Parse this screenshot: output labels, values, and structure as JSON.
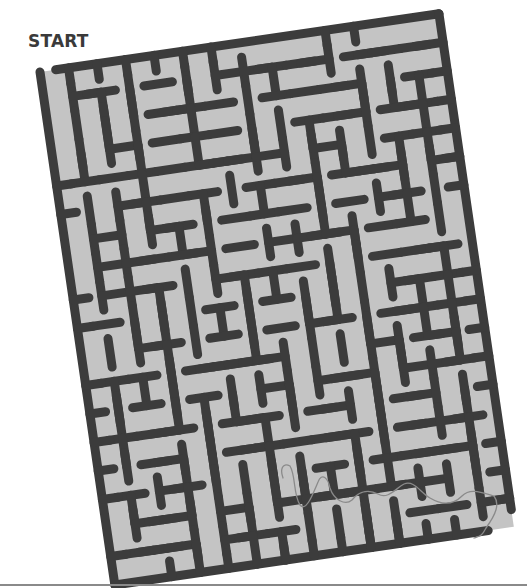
{
  "puzzle": {
    "start_label": "START",
    "finish_label": "FINISH",
    "colors": {
      "wall": "#3c3c3c",
      "floor": "#c4c4c4",
      "background": "#ffffff",
      "pencil_path": "#8a8a8a"
    },
    "grid": {
      "cols": 14,
      "rows": 18,
      "cell": 28.8
    },
    "rotation_deg": -8.3,
    "origin": [
      40,
      72
    ]
  }
}
